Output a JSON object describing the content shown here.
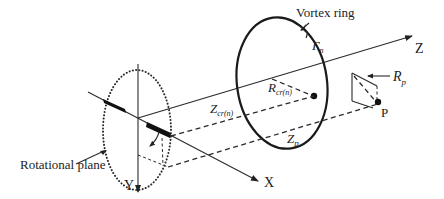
{
  "figure": {
    "labels": {
      "vortex_ring": "Vortex ring",
      "gamma": "Γ",
      "gamma_sub": "n",
      "z_axis": "Z",
      "x_axis": "X",
      "y_axis": "Y",
      "rp_main": "R",
      "rp_sub": "p",
      "rcr_main": "R",
      "rcr_sub": "cr(n)",
      "zcr_main": "Z",
      "zcr_sub": "cr(n)",
      "zp_main": "Z",
      "zp_sub": "p",
      "point_p": "P",
      "rotational_plane": "Rotational plane"
    },
    "colors": {
      "ink": "#222222",
      "background": "#ffffff"
    }
  }
}
